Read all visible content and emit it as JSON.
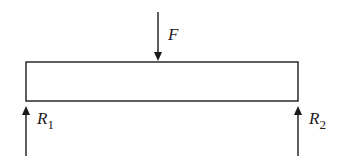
{
  "diagram": {
    "colors": {
      "stroke": "#1a1a1a",
      "background": "#ffffff"
    },
    "beam": {
      "x": 26,
      "y": 62,
      "width": 272,
      "height": 39
    },
    "forces": [
      {
        "id": "F",
        "label": "F",
        "subscript": "",
        "direction": "down",
        "x": 158,
        "y1": 12,
        "y2": 61
      },
      {
        "id": "R1",
        "label": "R",
        "subscript": "1",
        "direction": "up",
        "x": 26,
        "y1": 156,
        "y2": 106
      },
      {
        "id": "R2",
        "label": "R",
        "subscript": "2",
        "direction": "up",
        "x": 298,
        "y1": 156,
        "y2": 106
      }
    ]
  }
}
